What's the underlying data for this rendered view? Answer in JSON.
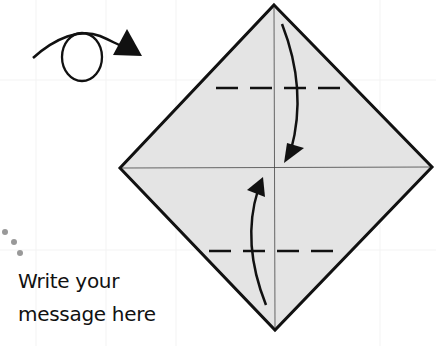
{
  "diagram": {
    "type": "origami-fold-instruction",
    "paper_color": "#e4e4e4",
    "outline_color": "#111111",
    "crease_color": "#444444",
    "symbols": [
      {
        "name": "turn-over-arrow",
        "meaning": "turn paper over"
      },
      {
        "name": "fold-top-down-arrow",
        "meaning": "fold top corner down to center"
      },
      {
        "name": "fold-bottom-up-arrow",
        "meaning": "fold bottom corner up to center"
      },
      {
        "name": "valley-fold-line-top"
      },
      {
        "name": "valley-fold-line-bottom"
      }
    ],
    "decoration_dots_color": "#999999"
  },
  "message": {
    "line1": "Write your",
    "line2": "message here"
  }
}
